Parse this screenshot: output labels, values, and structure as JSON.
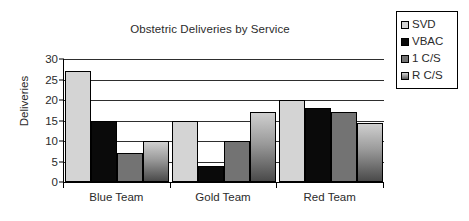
{
  "chart_data": {
    "type": "bar",
    "title": "Obstetric Deliveries by Service",
    "xlabel": "",
    "ylabel": "Deliveries",
    "categories": [
      "Blue Team",
      "Gold Team",
      "Red Team"
    ],
    "series": [
      {
        "name": "SVD",
        "color": "#d4d4d4",
        "values": [
          27,
          15,
          20
        ]
      },
      {
        "name": "VBAC",
        "color": "#0a0a0a",
        "values": [
          15,
          4,
          18
        ]
      },
      {
        "name": "1 C/S",
        "color": "#737373",
        "values": [
          7,
          10,
          17
        ]
      },
      {
        "name": "R C/S",
        "color": "#9a9a9a",
        "values": [
          10,
          17,
          14.5
        ]
      }
    ],
    "ylim": [
      0,
      30
    ],
    "yticks": [
      0,
      5,
      10,
      15,
      20,
      25,
      30
    ],
    "ytick_labels": [
      "0",
      "5",
      "10",
      "15",
      "20",
      "25",
      "30"
    ],
    "grid": true,
    "legend_position": "top-right"
  },
  "legend": {
    "items": [
      {
        "label": "SVD"
      },
      {
        "label": "VBAC"
      },
      {
        "label": "1 C/S"
      },
      {
        "label": "R C/S"
      }
    ]
  }
}
